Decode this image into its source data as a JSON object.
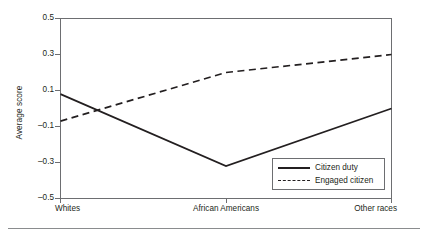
{
  "chart_data": {
    "type": "line",
    "title": "",
    "subtitle": "",
    "xlabel": "",
    "ylabel": "Average score",
    "categories": [
      "Whites",
      "African Americans",
      "Other races"
    ],
    "series": [
      {
        "name": "Citizen duty",
        "style": "solid",
        "color": "#231f20",
        "values": [
          0.08,
          -0.32,
          0.0
        ]
      },
      {
        "name": "Engaged citizen",
        "style": "dashed",
        "color": "#231f20",
        "values": [
          -0.07,
          0.2,
          0.3
        ]
      }
    ],
    "ylim": [
      -0.5,
      0.5
    ],
    "yticks": [
      0.5,
      0.3,
      0.1,
      -0.1,
      -0.3,
      -0.5
    ],
    "ytick_labels": [
      "0.5",
      "0.3",
      "0.1",
      "–0.1",
      "–0.3",
      "–0.5"
    ],
    "grid": false,
    "legend_position": "bottom-right",
    "legend_entries": [
      "Citizen duty",
      "Engaged citizen"
    ],
    "axis_color": "#6d6e71",
    "text_color": "#231f20"
  }
}
